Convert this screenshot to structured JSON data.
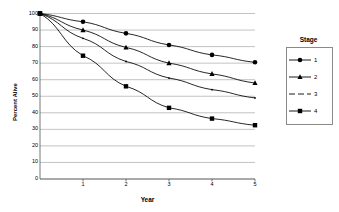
{
  "chart_data": {
    "type": "line",
    "title": "",
    "xlabel": "Year",
    "ylabel": "Percent Alive",
    "x": [
      0,
      1,
      2,
      3,
      4,
      5
    ],
    "xlim": [
      0,
      5
    ],
    "ylim": [
      0,
      100
    ],
    "xticks": [
      "1",
      "2",
      "3",
      "4",
      "5"
    ],
    "yticks": [
      "0",
      "10",
      "20",
      "30",
      "40",
      "50",
      "60",
      "70",
      "80",
      "90",
      "100"
    ],
    "grid": "horizontal",
    "legend_position": "right",
    "legend_title": "Stage",
    "series": [
      {
        "name": "1",
        "marker": "circle",
        "values": [
          100,
          95,
          88,
          81,
          75,
          70.5
        ]
      },
      {
        "name": "2",
        "marker": "triangle",
        "values": [
          100,
          90,
          79.5,
          70,
          63.5,
          58
        ]
      },
      {
        "name": "3",
        "marker": "dot",
        "values": [
          100,
          85,
          71,
          61,
          54,
          49
        ]
      },
      {
        "name": "4",
        "marker": "square",
        "values": [
          100,
          74.5,
          56,
          43,
          36.5,
          32.5
        ]
      }
    ]
  },
  "axes": {
    "ylabel": "Percent Alive",
    "xlabel": "Year"
  },
  "legend": {
    "title": "Stage",
    "items": [
      {
        "label": "1",
        "marker": "circle"
      },
      {
        "label": "2",
        "marker": "triangle"
      },
      {
        "label": "3",
        "marker": "dot"
      },
      {
        "label": "4",
        "marker": "square"
      }
    ]
  },
  "colors": {
    "series": "#000000",
    "grid": "#a9a9a9",
    "axis": "#555555",
    "legend_border": "#8a8a8a",
    "background": "#ffffff"
  }
}
